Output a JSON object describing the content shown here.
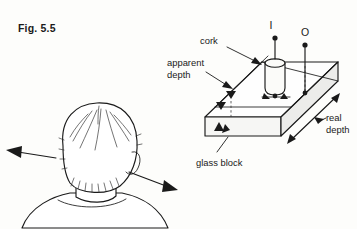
{
  "figure": {
    "number_label": "Fig. 5.5",
    "topic": "apparent depth through a glass block"
  },
  "labels": {
    "cork": "cork",
    "apparent_depth_line1": "apparent",
    "apparent_depth_line2": "depth",
    "real_depth_line1": "real",
    "real_depth_line2": "depth",
    "glass_block": "glass block",
    "image_point": "I",
    "object_point": "O"
  },
  "icons": {
    "cork_cylinder": "cork-cylinder-icon",
    "glass_block": "glass-block-icon",
    "observer_head": "observer-head-icon",
    "left_arrow": "left-arrow-icon",
    "right_arrow": "right-arrow-icon",
    "cork_leader_arrow": "cork-leader-arrow-icon",
    "apparent_depth_arrow": "apparent-depth-arrow-icon",
    "real_depth_arrow": "real-depth-arrow-icon",
    "pin_i": "pin-image-icon",
    "pin_o": "pin-object-icon"
  },
  "colors": {
    "background": "#fdfdfb",
    "ink": "#1a1a1a",
    "face_top": "#fefefe",
    "face_front": "#f6f6f4",
    "face_side": "#ececea"
  }
}
